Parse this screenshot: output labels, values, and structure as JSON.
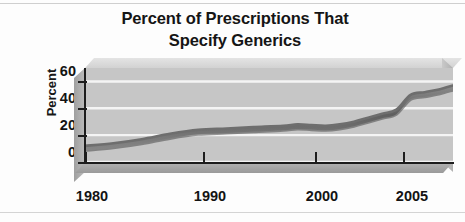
{
  "chart_data": {
    "type": "area",
    "title": "Percent of Prescriptions That Specify Generics",
    "title_lines": [
      "Percent of Prescriptions That",
      "Specify Generics"
    ],
    "xlabel": "",
    "ylabel": "Percent",
    "ylim": [
      0,
      70
    ],
    "xlim": [
      1980,
      2006
    ],
    "yticks": [
      60,
      40,
      20,
      0
    ],
    "xticks": [
      1980,
      1990,
      2000,
      2005
    ],
    "xtick_labels": [
      "1980",
      "1990",
      "2000",
      "2005"
    ],
    "ytick_labels": [
      "60",
      "40",
      "20",
      "0"
    ],
    "grid": "horizontal-white",
    "legend": "none",
    "series_name": "Percent of prescriptions specifying generics",
    "x": [
      1980,
      1982,
      1984,
      1986,
      1988,
      1990,
      1992,
      1994,
      1995,
      1996,
      1997,
      1998,
      1999,
      2000,
      2001,
      2002,
      2003,
      2004,
      2005,
      2006
    ],
    "values": [
      12,
      14,
      17,
      21,
      24,
      25,
      26,
      27,
      28,
      27.5,
      27,
      28,
      30,
      33,
      36,
      39,
      50,
      52,
      54,
      57
    ],
    "colors": {
      "plot_background": "#c6c6c6",
      "gridline": "#f4f4f4",
      "ribbon": "#6e6e6e",
      "ribbon_shadow": "#4a4a4a",
      "axis": "#1d1d1d",
      "text": "#131313",
      "page_background": "#fdfdfd"
    }
  },
  "page": {
    "scan_rule_top": "",
    "scan_rule_bottom": ""
  }
}
